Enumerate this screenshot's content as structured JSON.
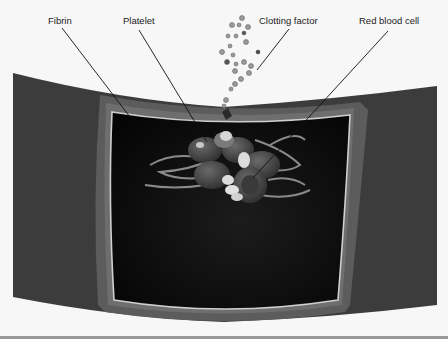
{
  "figure": {
    "labels": [
      {
        "id": "fibrin",
        "text": "Fibrin",
        "x": 48,
        "y": 15
      },
      {
        "id": "platelet",
        "text": "Platelet",
        "x": 123,
        "y": 15
      },
      {
        "id": "clotting-factor",
        "text": "Clotting factor",
        "x": 259,
        "y": 15
      },
      {
        "id": "red-blood-cell",
        "text": "Red blood cell",
        "x": 359,
        "y": 15
      }
    ],
    "colors": {
      "background": "#f7f7f7",
      "vessel_wall": "#3a3a3a",
      "vessel_rim": "#5a5a5a",
      "lumen": "#0c0c0c",
      "endothelium_line": "#cfcfcf",
      "red_cell": "#4a4a4a",
      "platelet": "#d8d8d8",
      "fibrin": "#8a8a8a"
    }
  }
}
